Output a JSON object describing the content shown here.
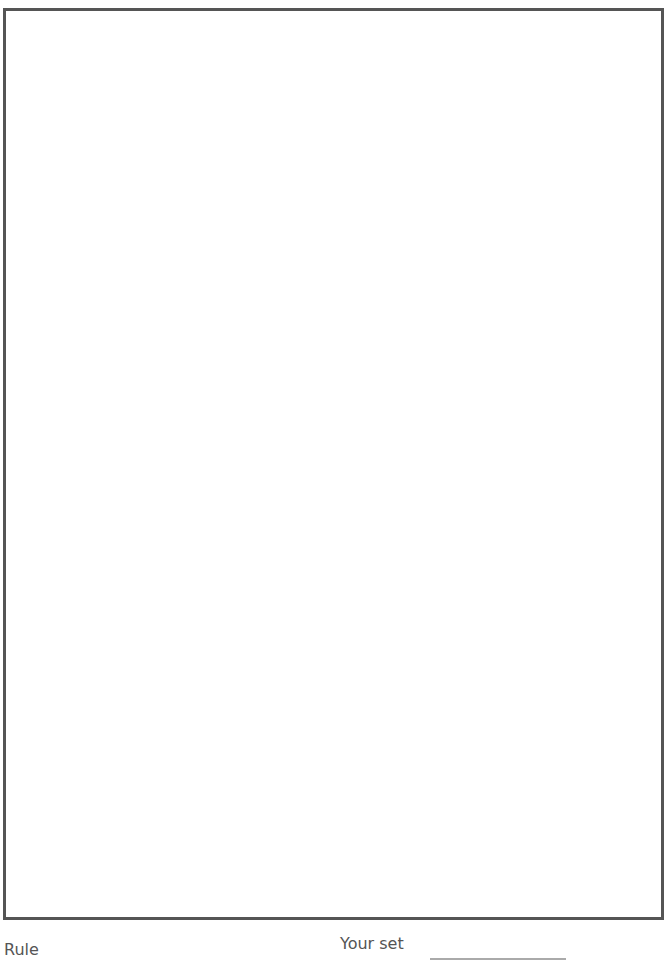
{
  "footer": {
    "rule_label": "Rule",
    "your_set_label": "Your set"
  },
  "grid": {
    "cell_w": 10.9,
    "cell_h": 10.7,
    "origin_x": 5,
    "origin_y": 216,
    "rows": [
      "...............33........................333..................................58",
      "..............3322.........1.....2222...1...2233..................................57",
      "3...........33223 2",
      "",
      "",
      ""
    ],
    "cells": []
  }
}
